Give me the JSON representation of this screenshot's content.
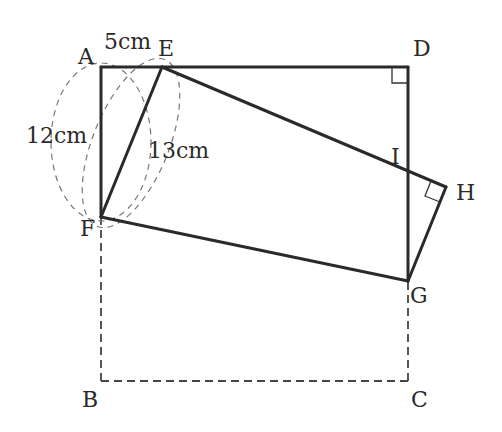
{
  "diagram": {
    "points": {
      "A": {
        "label": "A",
        "x": 101,
        "y": 67
      },
      "E": {
        "label": "E",
        "x": 162,
        "y": 67
      },
      "D": {
        "label": "D",
        "x": 408,
        "y": 67
      },
      "I": {
        "label": "I",
        "x": 408,
        "y": 172
      },
      "H": {
        "label": "H",
        "x": 446,
        "y": 187
      },
      "G": {
        "label": "G",
        "x": 408,
        "y": 281
      },
      "F": {
        "label": "F",
        "x": 101,
        "y": 217
      },
      "B": {
        "label": "B",
        "x": 101,
        "y": 381
      },
      "C": {
        "label": "C",
        "x": 408,
        "y": 381
      }
    },
    "measurements": {
      "AE": "5cm",
      "AF": "12cm",
      "EF": "13cm"
    },
    "right_angle_marks": [
      "D",
      "H"
    ],
    "colors": {
      "line": "#2a2a2a",
      "dashed": "#444444",
      "background": "#ffffff"
    }
  }
}
